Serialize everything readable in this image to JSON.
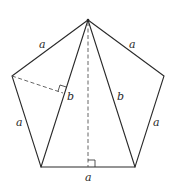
{
  "figure": {
    "type": "regular-pentagon-with-inscribed-triangle",
    "colors": {
      "stroke": "#2a2a2a",
      "dashed": "#555555",
      "background": "#ffffff"
    },
    "vertices": {
      "apex": [
        88,
        20
      ],
      "upper_left": [
        12,
        76
      ],
      "upper_right": [
        164,
        76
      ],
      "lower_left": [
        41,
        167
      ],
      "lower_right": [
        135,
        167
      ]
    },
    "labels": {
      "side_top_left": "a",
      "side_top_right": "a",
      "side_left": "a",
      "side_right": "a",
      "side_bottom": "a",
      "diagonal_left": "b",
      "diagonal_right": "b"
    }
  }
}
